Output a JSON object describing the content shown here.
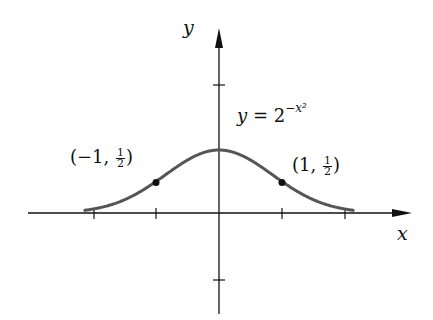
{
  "figure": {
    "x_axis_label": "x",
    "y_axis_label": "y",
    "equation": {
      "lhs": "y",
      "eq": "=",
      "base": "2",
      "exponent": "−x²"
    },
    "points": [
      {
        "label_open": "(−1, ",
        "num": "1",
        "den": "2",
        "label_close": ")"
      },
      {
        "label_open": "(1, ",
        "num": "1",
        "den": "2",
        "label_close": ")"
      }
    ]
  },
  "chart_data": {
    "type": "line",
    "title": "",
    "function": "y = 2^(-x^2)",
    "xlabel": "x",
    "ylabel": "y",
    "xlim": [
      -2.2,
      2.2
    ],
    "ylim": [
      -1.5,
      2.5
    ],
    "x_ticks": [
      -2,
      -1,
      0,
      1,
      2
    ],
    "y_ticks": [
      -1,
      2
    ],
    "series": [
      {
        "name": "y = 2^{-x^2}",
        "x": [
          -2.1,
          -2,
          -1.5,
          -1,
          -0.5,
          0,
          0.5,
          1,
          1.5,
          2,
          2.1
        ],
        "values": [
          0.047,
          0.0625,
          0.21,
          0.5,
          0.84,
          1,
          0.84,
          0.5,
          0.21,
          0.0625,
          0.047
        ]
      }
    ],
    "marked_points": [
      {
        "x": -1,
        "y": 0.5,
        "label": "(-1, 1/2)"
      },
      {
        "x": 1,
        "y": 0.5,
        "label": "(1, 1/2)"
      }
    ],
    "grid": false,
    "curve_color": "#555555"
  }
}
